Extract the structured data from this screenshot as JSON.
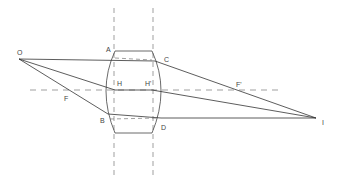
{
  "diagram": {
    "colors": {
      "line": "#333333",
      "dash": "#777777",
      "label": "#444444"
    },
    "labels": {
      "O": "O",
      "A": "A",
      "C": "C",
      "H": "H",
      "H_prime": "H'",
      "F": "F",
      "F_prime": "F'",
      "B": "B",
      "D": "D",
      "I": "I"
    },
    "points": {
      "O": [
        19,
        59
      ],
      "I": [
        316,
        118
      ],
      "A": [
        115,
        51
      ],
      "C": [
        155,
        61
      ],
      "H": [
        115,
        90
      ],
      "H_prime": [
        152,
        90
      ],
      "F": [
        66,
        90
      ],
      "F_prime": [
        239,
        90
      ],
      "B": [
        108,
        114
      ],
      "D": [
        161,
        118
      ]
    },
    "principal_planes_x": [
      114,
      153
    ],
    "optical_axis_y": 90
  }
}
